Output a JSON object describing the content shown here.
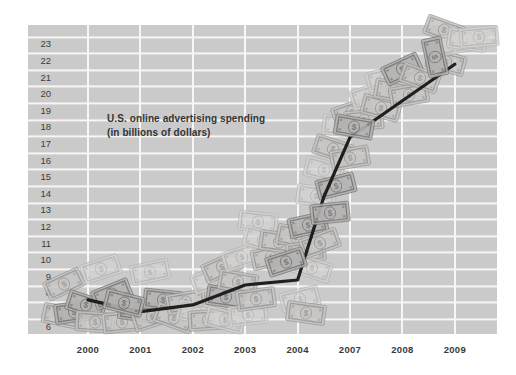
{
  "page": {
    "background": "#ffffff",
    "plot_background": "#cbcaca",
    "gridline_color": "#f7f6f5"
  },
  "title": {
    "line1": "U.S. online advertising spending",
    "line2": "(in billions of dollars)"
  },
  "chart_data": {
    "type": "line",
    "title": "U.S. online advertising spending (in billions of dollars)",
    "categories": [
      "2000",
      "2001",
      "2002",
      "2003",
      "2004",
      "2007",
      "2008",
      "2009"
    ],
    "values": [
      7.6,
      6.9,
      7.3,
      8.5,
      8.8,
      17.4,
      19.6,
      21.8
    ],
    "series": [
      {
        "name": "U.S. online advertising spending ($B)",
        "values": [
          7.6,
          6.9,
          7.3,
          8.5,
          8.8,
          17.4,
          19.6,
          21.8
        ]
      }
    ],
    "y_tick_labels": [
      "23",
      "22",
      "21",
      "20",
      "19",
      "18",
      "17",
      "16",
      "15",
      "14",
      "13",
      "12",
      "11",
      "10",
      "9",
      "8",
      "7",
      "6"
    ],
    "y_top_value": 23,
    "ylim": [
      6,
      23
    ],
    "xlabel": "",
    "ylabel": "",
    "legend": "none",
    "grid": "white gridlines over gray bands",
    "note": "x-axis omits years 2005 and 2006; labels equally spaced",
    "line_color": "#1f1f1f",
    "render": {
      "plot": {
        "left": 28,
        "top": 25,
        "width": 469,
        "height": 309
      },
      "x0": 88,
      "xstep": 52.4,
      "first_gridline_y": 11,
      "band_pitch": 16.6,
      "line_width": 3.2,
      "bend_point": {
        "xi": 4.5,
        "value": 13.8
      }
    },
    "bill_shades": {
      "L": {
        "a": "#d5d4d3",
        "b": "#b3b2b1",
        "o": 0.78
      },
      "M": {
        "a": "#c7c6c5",
        "b": "#979695",
        "o": 0.85
      },
      "D": {
        "a": "#b4b3b2",
        "b": "#767574",
        "o": 0.9
      }
    },
    "bills": [
      [
        64,
        284,
        -25,
        "M",
        0
      ],
      [
        62,
        316,
        12,
        "M",
        0
      ],
      [
        74,
        312,
        -8,
        "D",
        0
      ],
      [
        86,
        305,
        18,
        "D",
        0
      ],
      [
        95,
        322,
        4,
        "M",
        0
      ],
      [
        101,
        269,
        -18,
        "L",
        0
      ],
      [
        112,
        294,
        -22,
        "D",
        0
      ],
      [
        124,
        303,
        14,
        "D",
        1
      ],
      [
        122,
        322,
        -6,
        "M",
        0
      ],
      [
        138,
        311,
        8,
        "D",
        0
      ],
      [
        150,
        272,
        -12,
        "L",
        0
      ],
      [
        152,
        317,
        -18,
        "M",
        0
      ],
      [
        163,
        300,
        6,
        "D",
        0
      ],
      [
        174,
        318,
        20,
        "M",
        0
      ],
      [
        186,
        302,
        -10,
        "M",
        0
      ],
      [
        197,
        313,
        12,
        "L",
        0
      ],
      [
        208,
        320,
        -4,
        "M",
        0
      ],
      [
        211,
        279,
        -20,
        "L",
        0
      ],
      [
        226,
        297,
        8,
        "D",
        0
      ],
      [
        225,
        320,
        14,
        "L",
        0
      ],
      [
        222,
        267,
        -24,
        "M",
        0
      ],
      [
        238,
        282,
        10,
        "M",
        0
      ],
      [
        242,
        257,
        -18,
        "L",
        0
      ],
      [
        248,
        315,
        -6,
        "L",
        0
      ],
      [
        256,
        299,
        -8,
        "M",
        0
      ],
      [
        258,
        222,
        6,
        "L",
        0
      ],
      [
        263,
        240,
        16,
        "L",
        0
      ],
      [
        271,
        257,
        -12,
        "M",
        0
      ],
      [
        279,
        242,
        8,
        "M",
        0
      ],
      [
        286,
        262,
        -18,
        "D",
        1
      ],
      [
        296,
        237,
        12,
        "M",
        0
      ],
      [
        300,
        299,
        -14,
        "L",
        0
      ],
      [
        306,
        313,
        8,
        "M",
        0
      ],
      [
        306,
        252,
        -6,
        "M",
        0
      ],
      [
        312,
        268,
        18,
        "L",
        0
      ],
      [
        308,
        225,
        -12,
        "D",
        0
      ],
      [
        316,
        196,
        8,
        "L",
        0
      ],
      [
        320,
        243,
        -20,
        "M",
        0
      ],
      [
        324,
        170,
        14,
        "L",
        0
      ],
      [
        330,
        213,
        -6,
        "D",
        1
      ],
      [
        333,
        149,
        18,
        "M",
        0
      ],
      [
        336,
        186,
        -14,
        "D",
        0
      ],
      [
        342,
        126,
        6,
        "L",
        0
      ],
      [
        350,
        158,
        -10,
        "M",
        0
      ],
      [
        352,
        112,
        -20,
        "M",
        0
      ],
      [
        354,
        127,
        10,
        "D",
        1
      ],
      [
        364,
        120,
        -5,
        "M",
        0
      ],
      [
        370,
        95,
        -20,
        "L",
        0
      ],
      [
        381,
        108,
        15,
        "M",
        0
      ],
      [
        386,
        78,
        -15,
        "L",
        0
      ],
      [
        394,
        91,
        10,
        "M",
        0
      ],
      [
        402,
        69,
        -25,
        "D",
        0
      ],
      [
        409,
        95,
        -10,
        "M",
        0
      ],
      [
        420,
        78,
        20,
        "M",
        0
      ],
      [
        435,
        57,
        78,
        "D",
        1
      ],
      [
        446,
        62,
        15,
        "M",
        0
      ],
      [
        444,
        30,
        20,
        "M",
        0
      ],
      [
        452,
        44,
        -10,
        "L",
        0
      ],
      [
        467,
        40,
        8,
        "L",
        0
      ],
      [
        479,
        37,
        -5,
        "L",
        0
      ]
    ]
  }
}
